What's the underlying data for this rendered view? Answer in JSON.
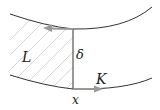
{
  "diagram": {
    "labels": {
      "region": "L",
      "gap": "δ",
      "flux": "K",
      "position": "x"
    },
    "colors": {
      "curve": "#333333",
      "arrow": "#999999",
      "hatch": "#cccccc",
      "background": "#ffffff"
    },
    "elements": [
      {
        "type": "curve",
        "name": "upper-boundary"
      },
      {
        "type": "curve",
        "name": "lower-boundary"
      },
      {
        "type": "line",
        "name": "vertical-cut",
        "label": "δ"
      },
      {
        "type": "arrow",
        "name": "upper-arrow",
        "direction": "left"
      },
      {
        "type": "arrow",
        "name": "lower-arrow",
        "direction": "right",
        "label": "K"
      },
      {
        "type": "hatched-region",
        "name": "region-L",
        "label": "L"
      }
    ]
  }
}
